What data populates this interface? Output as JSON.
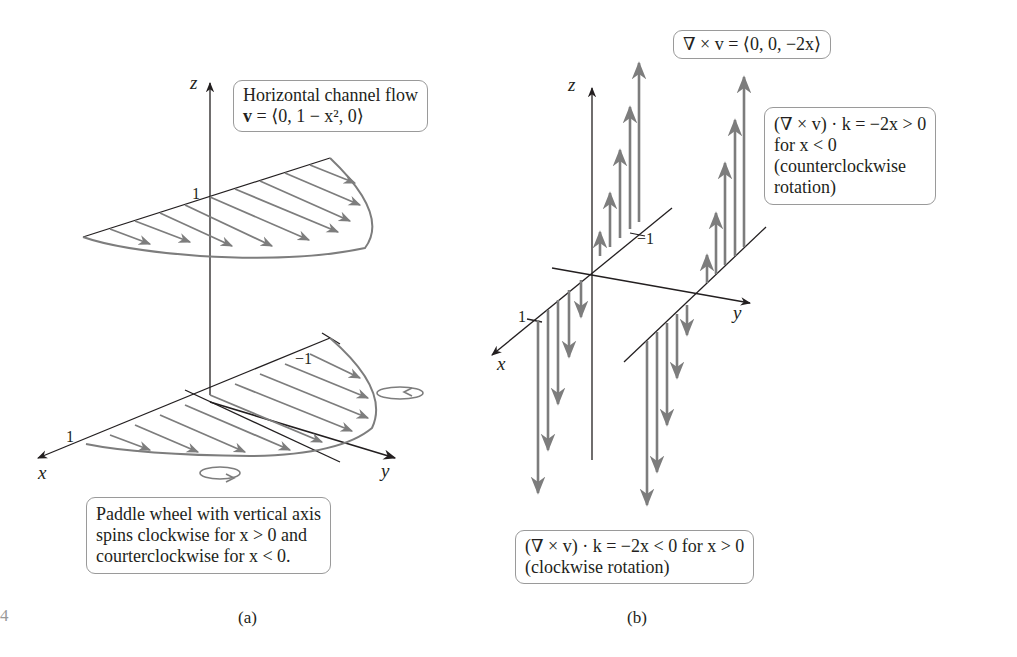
{
  "panel_a": {
    "caption": "(a)",
    "flow_box": {
      "line1": "Horizontal channel flow",
      "line2_prefix": "v",
      "line2_rest": " = ⟨0, 1 − x², 0⟩"
    },
    "paddle_box": {
      "line1": "Paddle wheel with vertical axis",
      "line2": "spins clockwise for x > 0 and",
      "line3": "courterclockwise for x < 0."
    },
    "axes": {
      "x": "x",
      "y": "y",
      "z": "z"
    },
    "ticks": {
      "z_one": "1",
      "x_one": "1",
      "y_neg_one": "−1"
    }
  },
  "panel_b": {
    "caption": "(b)",
    "curl_box": {
      "text": "∇ × v = ⟨0, 0, −2x⟩"
    },
    "ccw_box": {
      "line1": "(∇ × v) · k = −2x > 0",
      "line2": "for x < 0",
      "line3": "(counterclockwise",
      "line4": "rotation)"
    },
    "cw_box": {
      "line1": "(∇ × v) · k = −2x < 0 for x > 0",
      "line2": "(clockwise rotation)"
    },
    "axes": {
      "x": "x",
      "y": "y",
      "z": "z"
    },
    "ticks": {
      "x_one": "1",
      "y_neg_one": "−1"
    }
  },
  "page_margin_mark": "4",
  "colors": {
    "arrow": "#7d7d7d",
    "axis": "#231f20",
    "box_border": "#9a9a9a"
  }
}
